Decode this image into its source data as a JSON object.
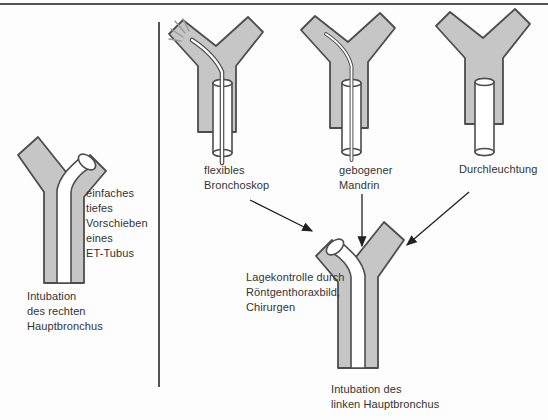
{
  "figure": {
    "left_panel": {
      "method_label": "einfaches\ntiefes\nVorschieben\neines\nET-Tubus",
      "result_label": "Intubation\ndes rechten\nHauptbronchus"
    },
    "right_panel": {
      "methods": [
        {
          "label": "flexibles\nBronchoskop"
        },
        {
          "label": "gebogener\nMandrin"
        },
        {
          "label": "Durchleuchtung"
        }
      ],
      "control_label": "Lagekontrolle durch\nRöntgenthoraxbild,\nChirurgen",
      "result_label": "Intubation des\nlinken Hauptbronchus"
    },
    "colors": {
      "bronchus-fill": "#c6c6c6",
      "outline": "#4d4d4d",
      "text": "#333333",
      "divider": "#555555",
      "ray": "#9a9a9a"
    }
  }
}
